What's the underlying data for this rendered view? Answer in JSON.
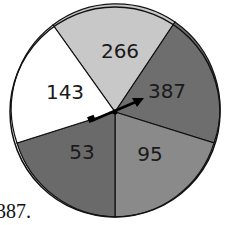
{
  "spinner": {
    "sectors": [
      {
        "label": "266",
        "color": "#c8c8c8"
      },
      {
        "label": "387",
        "color": "#6e6e6e"
      },
      {
        "label": "95",
        "color": "#8a8a8a"
      },
      {
        "label": "53",
        "color": "#6a6a6a"
      },
      {
        "label": "143",
        "color": "#ffffff"
      }
    ],
    "pointer": "arrow pointing to 387"
  },
  "caption": "387."
}
